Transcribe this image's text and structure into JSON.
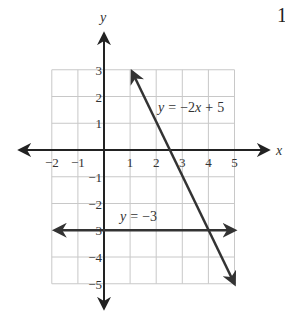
{
  "problem_number": "1",
  "chart_data": {
    "type": "line",
    "title": "",
    "xlabel": "x",
    "ylabel": "y",
    "xlim": [
      -2,
      5
    ],
    "ylim": [
      -5,
      3
    ],
    "grid": true,
    "x_ticks": [
      "-2",
      "-1",
      "1",
      "2",
      "3",
      "4",
      "5"
    ],
    "y_ticks": [
      "3",
      "2",
      "1",
      "-1",
      "-2",
      "-3",
      "-4",
      "-5"
    ],
    "series": [
      {
        "name": "y = −2x + 5",
        "equation": "y = -2x + 5",
        "x": [
          1,
          5
        ],
        "y": [
          3,
          -5
        ],
        "arrows": "both",
        "label": "y = −2x + 5"
      },
      {
        "name": "y = −3",
        "equation": "y = -3",
        "x": [
          -2,
          5
        ],
        "y": [
          -3,
          -3
        ],
        "arrows": "both",
        "label": "y = −3"
      }
    ],
    "annotations": [
      "y = −2x + 5",
      "y = −3"
    ],
    "colors": {
      "grid": "#c8c8c8",
      "axis": "#222222",
      "line": "#333333"
    }
  }
}
